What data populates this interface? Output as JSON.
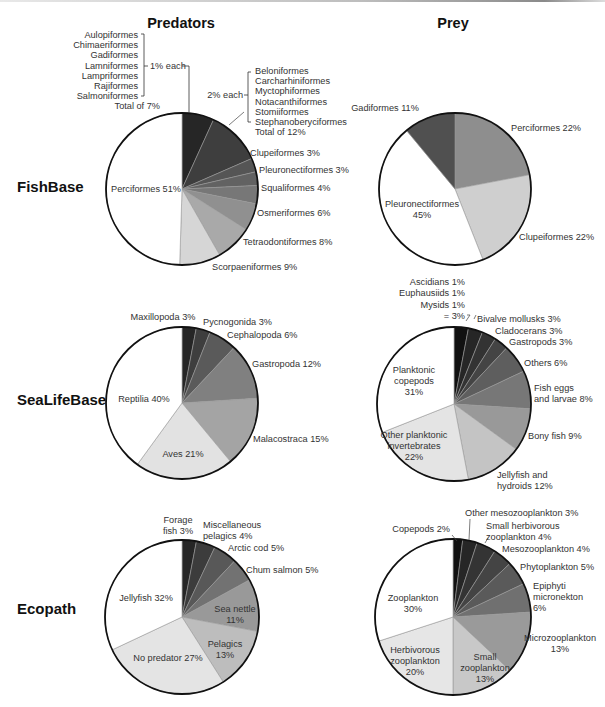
{
  "column_titles": {
    "predators": "Predators",
    "prey": "Prey"
  },
  "row_titles": {
    "fishbase": "FishBase",
    "sealifebase": "SeaLifeBase",
    "ecopath": "Ecopath"
  },
  "fishbase_predator_groups": {
    "one_pct_items": [
      "Aulopiformes",
      "Chimaeriformes",
      "Gadiformes",
      "Lamniformes",
      "Lampriformes",
      "Rajiformes",
      "Salmoniformes"
    ],
    "one_pct_label": "1% each",
    "one_pct_total": "Total of 7%",
    "two_pct_items": [
      "Beloniformes",
      "Carcharhiniformes",
      "Myctophiformes",
      "Notacanthiformes",
      "Stomiiformes",
      "Stephanoberyciformes"
    ],
    "two_pct_label": "2% each",
    "two_pct_total": "Total of 12%"
  },
  "sealifebase_prey_group": {
    "items": [
      "Ascidians 1%",
      "Euphausiids 1%",
      "Mysids 1%"
    ],
    "total": "= 3%"
  },
  "chart_data": [
    {
      "type": "pie",
      "row": "FishBase",
      "column": "Predators",
      "cx": 182,
      "cy": 189,
      "r": 76,
      "slices": [
        {
          "name": "1% each group (7 orders)",
          "value": 7,
          "color": "#262626",
          "label": ""
        },
        {
          "name": "2% each group (6 orders)",
          "value": 12,
          "color": "#3e3e3e",
          "label": ""
        },
        {
          "name": "Clupeiformes",
          "value": 3,
          "color": "#555555",
          "label": "Clupeiformes 3%",
          "lx": 250,
          "ly": 156,
          "anchor": "start"
        },
        {
          "name": "Pleuronectiformes",
          "value": 3,
          "color": "#626262",
          "label": "Pleuronectiformes 3%",
          "lx": 259,
          "ly": 173,
          "anchor": "start"
        },
        {
          "name": "Squaliformes",
          "value": 4,
          "color": "#777777",
          "label": "Squaliformes 4%",
          "lx": 261,
          "ly": 191,
          "anchor": "start"
        },
        {
          "name": "Osmeriformes",
          "value": 6,
          "color": "#909090",
          "label": "Osmeriformes 6%",
          "lx": 257,
          "ly": 216,
          "anchor": "start"
        },
        {
          "name": "Tetraodontiformes",
          "value": 8,
          "color": "#a9a9a9",
          "label": "Tetraodontiformes 8%",
          "lx": 243,
          "ly": 245,
          "anchor": "start"
        },
        {
          "name": "Scorpaeniformes",
          "value": 9,
          "color": "#d6d6d6",
          "label": "Scorpaeniformes 9%",
          "lx": 212,
          "ly": 270,
          "anchor": "start"
        },
        {
          "name": "Perciformes",
          "value": 51,
          "color": "#ffffff",
          "label": "Perciformes 51%",
          "lx": 146,
          "ly": 192,
          "anchor": "middle"
        }
      ]
    },
    {
      "type": "pie",
      "row": "FishBase",
      "column": "Prey",
      "cx": 455,
      "cy": 189,
      "r": 76,
      "slices": [
        {
          "name": "Perciformes",
          "value": 22,
          "color": "#8e8e8e",
          "label": "Perciformes 22%",
          "lx": 511,
          "ly": 131,
          "anchor": "start"
        },
        {
          "name": "Clupeiformes",
          "value": 22,
          "color": "#cfcfcf",
          "label": "Clupeiformes 22%",
          "lx": 519,
          "ly": 240,
          "anchor": "start"
        },
        {
          "name": "Pleuronectiformes",
          "value": 45,
          "color": "#ffffff",
          "label": "Pleuronectiformes|45%",
          "lx": 422,
          "ly": 207,
          "anchor": "middle"
        },
        {
          "name": "Gadiformes",
          "value": 11,
          "color": "#505050",
          "label": "Gadiformes 11%",
          "lx": 385,
          "ly": 111,
          "anchor": "middle"
        }
      ]
    },
    {
      "type": "pie",
      "row": "SeaLifeBase",
      "column": "Predators",
      "cx": 182,
      "cy": 403,
      "r": 76,
      "slices": [
        {
          "name": "Maxillopoda",
          "value": 3,
          "color": "#262626",
          "label": "Maxillopoda 3%",
          "lx": 163,
          "ly": 320,
          "anchor": "middle"
        },
        {
          "name": "Pycnogonida",
          "value": 3,
          "color": "#3e3e3e",
          "label": "Pycnogonida 3%",
          "lx": 203,
          "ly": 325,
          "anchor": "start"
        },
        {
          "name": "Cephalopoda",
          "value": 6,
          "color": "#5a5a5a",
          "label": "Cephalopoda 6%",
          "lx": 227,
          "ly": 338,
          "anchor": "start"
        },
        {
          "name": "Gastropoda",
          "value": 12,
          "color": "#808080",
          "label": "Gastropoda 12%",
          "lx": 252,
          "ly": 367,
          "anchor": "start"
        },
        {
          "name": "Malacostraca",
          "value": 15,
          "color": "#a4a4a4",
          "label": "Malacostraca 15%",
          "lx": 253,
          "ly": 442,
          "anchor": "start"
        },
        {
          "name": "Aves",
          "value": 21,
          "color": "#e2e2e2",
          "label": "Aves 21%",
          "lx": 183,
          "ly": 457,
          "anchor": "middle"
        },
        {
          "name": "Reptilia",
          "value": 40,
          "color": "#ffffff",
          "label": "Reptilia 40%",
          "lx": 144,
          "ly": 402,
          "anchor": "middle"
        }
      ]
    },
    {
      "type": "pie",
      "row": "SeaLifeBase",
      "column": "Prey",
      "cx": 454,
      "cy": 404,
      "r": 77,
      "slices": [
        {
          "name": "Ascidians, Euphausiids, Mysids (1% each)",
          "value": 3,
          "color": "#111111",
          "label": ""
        },
        {
          "name": "Bivalve mollusks",
          "value": 3,
          "color": "#262626",
          "label": "Bivalve mollusks 3%",
          "lx": 477,
          "ly": 322,
          "anchor": "start"
        },
        {
          "name": "Cladocerans",
          "value": 3,
          "color": "#333333",
          "label": "Cladocerans 3%",
          "lx": 495,
          "ly": 334,
          "anchor": "start"
        },
        {
          "name": "Gastropods",
          "value": 3,
          "color": "#444444",
          "label": "Gastropods 3%",
          "lx": 509,
          "ly": 345,
          "anchor": "start"
        },
        {
          "name": "Others",
          "value": 6,
          "color": "#5e5e5e",
          "label": "Others 6%",
          "lx": 524,
          "ly": 366,
          "anchor": "start"
        },
        {
          "name": "Fish eggs and larvae",
          "value": 8,
          "color": "#777777",
          "label": "Fish eggs|and larvae 8%",
          "lx": 534,
          "ly": 391,
          "anchor": "start"
        },
        {
          "name": "Bony fish",
          "value": 9,
          "color": "#999999",
          "label": "Bony fish 9%",
          "lx": 528,
          "ly": 439,
          "anchor": "start"
        },
        {
          "name": "Jellyfish and hydroids",
          "value": 12,
          "color": "#c4c4c4",
          "label": "Jellyfish and|hydroids 12%",
          "lx": 497,
          "ly": 478,
          "anchor": "start"
        },
        {
          "name": "Other planktonic invertebrates",
          "value": 22,
          "color": "#e4e4e4",
          "label": "Other planktonic|invertebrates|22%",
          "lx": 414,
          "ly": 438,
          "anchor": "middle"
        },
        {
          "name": "Planktonic copepods",
          "value": 31,
          "color": "#ffffff",
          "label": "Planktonic|copepods|31%",
          "lx": 414,
          "ly": 373,
          "anchor": "middle"
        }
      ]
    },
    {
      "type": "pie",
      "row": "Ecopath",
      "column": "Predators",
      "cx": 182,
      "cy": 617,
      "r": 77,
      "slices": [
        {
          "name": "Forage fish",
          "value": 3,
          "color": "#262626",
          "label": "Forage|fish 3%",
          "lx": 178,
          "ly": 523,
          "anchor": "middle"
        },
        {
          "name": "Miscellaneous pelagics",
          "value": 4,
          "color": "#3c3c3c",
          "label": "Miscellaneous|pelagics 4%",
          "lx": 203,
          "ly": 528,
          "anchor": "start"
        },
        {
          "name": "Arctic cod",
          "value": 5,
          "color": "#585858",
          "label": "Arctic cod 5%",
          "lx": 228,
          "ly": 551,
          "anchor": "start"
        },
        {
          "name": "Chum salmon",
          "value": 5,
          "color": "#727272",
          "label": "Chum salmon 5%",
          "lx": 246,
          "ly": 573,
          "anchor": "start"
        },
        {
          "name": "Sea nettle",
          "value": 11,
          "color": "#999999",
          "label": "Sea nettle|11%",
          "lx": 235,
          "ly": 612,
          "anchor": "middle"
        },
        {
          "name": "Pelagics",
          "value": 13,
          "color": "#bdbdbd",
          "label": "Pelagics|13%",
          "lx": 225,
          "ly": 647,
          "anchor": "middle"
        },
        {
          "name": "No predator",
          "value": 27,
          "color": "#e4e4e4",
          "label": "No predator 27%",
          "lx": 168,
          "ly": 661,
          "anchor": "middle"
        },
        {
          "name": "Jellyfish",
          "value": 32,
          "color": "#ffffff",
          "label": "Jellyfish 32%",
          "lx": 146,
          "ly": 601,
          "anchor": "middle"
        }
      ]
    },
    {
      "type": "pie",
      "row": "Ecopath",
      "column": "Prey",
      "cx": 453,
      "cy": 617,
      "r": 78,
      "slices": [
        {
          "name": "Copepods",
          "value": 2,
          "color": "#111111",
          "label": "Copepods 2%",
          "lx": 450,
          "ly": 532,
          "anchor": "end"
        },
        {
          "name": "Other mesozooplankton",
          "value": 3,
          "color": "#262626",
          "label": "Other mesozooplankton 3%",
          "lx": 465,
          "ly": 516,
          "anchor": "start"
        },
        {
          "name": "Small herbivorous zooplankton",
          "value": 4,
          "color": "#343434",
          "label": "Small herbivorous|zooplankton 4%",
          "lx": 486,
          "ly": 529,
          "anchor": "start"
        },
        {
          "name": "Mesozooplankton",
          "value": 4,
          "color": "#444444",
          "label": "Mesozooplankton 4%",
          "lx": 502,
          "ly": 552,
          "anchor": "start"
        },
        {
          "name": "Phytoplankton",
          "value": 5,
          "color": "#5a5a5a",
          "label": "Phytoplankton 5%",
          "lx": 520,
          "ly": 570,
          "anchor": "start"
        },
        {
          "name": "Epiphyti micronekton",
          "value": 6,
          "color": "#707070",
          "label": "Epiphyti|micronekton|6%",
          "lx": 533,
          "ly": 589,
          "anchor": "start"
        },
        {
          "name": "Microzooplankton",
          "value": 13,
          "color": "#9a9a9a",
          "label": "Microzooplankton|13%",
          "lx": 560,
          "ly": 641,
          "anchor": "middle"
        },
        {
          "name": "Small zooplankton",
          "value": 13,
          "color": "#c8c8c8",
          "label": "Small|zooplankton|13%",
          "lx": 485,
          "ly": 660,
          "anchor": "middle"
        },
        {
          "name": "Herbivorous zooplankton",
          "value": 20,
          "color": "#e6e6e6",
          "label": "Herbivorous|zooplankton|20%",
          "lx": 415,
          "ly": 653,
          "anchor": "middle"
        },
        {
          "name": "Zooplankton",
          "value": 30,
          "color": "#ffffff",
          "label": "Zooplankton|30%",
          "lx": 413,
          "ly": 601,
          "anchor": "middle"
        }
      ]
    }
  ]
}
